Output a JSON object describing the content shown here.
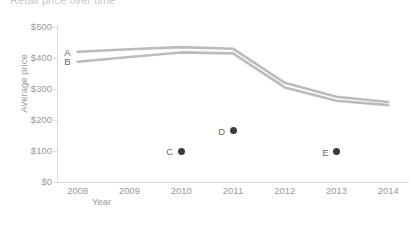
{
  "chart_data": {
    "type": "line",
    "title": "Retail price over time",
    "xlabel": "Year",
    "ylabel": "Average price",
    "x": [
      2008,
      2009,
      2010,
      2011,
      2012,
      2013,
      2014
    ],
    "xlim": [
      2007.6,
      2014.4
    ],
    "ylim": [
      0,
      500
    ],
    "xtick_labels": [
      "2008",
      "2009",
      "2010",
      "2011",
      "2012",
      "2013",
      "2014"
    ],
    "ytick_labels": [
      "$0",
      "$100",
      "$200",
      "$300",
      "$400",
      "$500"
    ],
    "ytick_values": [
      0,
      100,
      200,
      300,
      400,
      500
    ],
    "grid": false,
    "legend": "inline-labels",
    "line_color": "#bcbcbc",
    "point_color": "#3b3b3b",
    "series": [
      {
        "name": "A",
        "kind": "line",
        "label_x": 2008,
        "label_y": 420,
        "values": [
          420,
          428,
          435,
          430,
          320,
          275,
          258
        ]
      },
      {
        "name": "B",
        "kind": "line",
        "label_x": 2008,
        "label_y": 390,
        "values": [
          388,
          403,
          418,
          415,
          305,
          262,
          248
        ]
      },
      {
        "name": "C",
        "kind": "point",
        "x": 2010,
        "y": 100
      },
      {
        "name": "D",
        "kind": "point",
        "x": 2011,
        "y": 165
      },
      {
        "name": "E",
        "kind": "point",
        "x": 2013,
        "y": 97
      }
    ]
  }
}
